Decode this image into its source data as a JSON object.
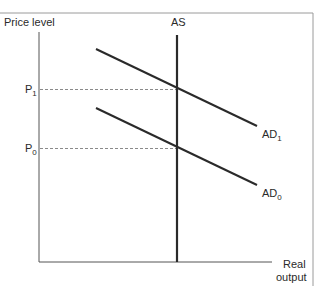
{
  "diagram": {
    "type": "AS-AD diagram",
    "y_axis_label": "Price level",
    "x_axis_label_line1": "Real",
    "x_axis_label_line2": "output",
    "curves": [
      {
        "name": "AS",
        "label": "AS",
        "kind": "vertical supply"
      },
      {
        "name": "AD1",
        "label_main": "AD",
        "label_sub": "1",
        "kind": "demand"
      },
      {
        "name": "AD0",
        "label_main": "AD",
        "label_sub": "0",
        "kind": "demand"
      }
    ],
    "price_levels": [
      {
        "name": "P1",
        "label_main": "P",
        "label_sub": "1"
      },
      {
        "name": "P0",
        "label_main": "P",
        "label_sub": "0"
      }
    ],
    "colors": {
      "line": "#2a2a2a",
      "axis": "#555555",
      "dashed": "#8a8a8a",
      "frame": "#999999"
    }
  }
}
